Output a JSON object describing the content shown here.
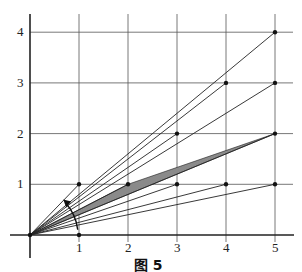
{
  "figure": {
    "caption": "图 5",
    "x_ticks": [
      "1",
      "2",
      "3",
      "4",
      "5"
    ],
    "y_ticks": [
      "1",
      "2",
      "3",
      "4"
    ],
    "origin_px": [
      30,
      235
    ],
    "unit_px": [
      49,
      50.7
    ],
    "points": [
      [
        1,
        1
      ],
      [
        2,
        1
      ],
      [
        3,
        1
      ],
      [
        4,
        1
      ],
      [
        5,
        1
      ],
      [
        3,
        2
      ],
      [
        5,
        2
      ],
      [
        4,
        3
      ],
      [
        5,
        3
      ],
      [
        5,
        4
      ],
      [
        1,
        0
      ]
    ],
    "rays_to": [
      [
        1,
        1
      ],
      [
        5,
        4
      ],
      [
        4,
        3
      ],
      [
        5,
        3
      ],
      [
        3,
        2
      ],
      [
        2,
        1
      ],
      [
        5,
        2
      ],
      [
        3,
        1
      ],
      [
        4,
        1
      ],
      [
        5,
        1
      ]
    ],
    "shaded_between": [
      [
        2,
        1
      ],
      [
        5,
        2
      ]
    ],
    "colors": {
      "grid": "#555555",
      "line": "#222222",
      "shade": "#8a8a8a"
    }
  }
}
